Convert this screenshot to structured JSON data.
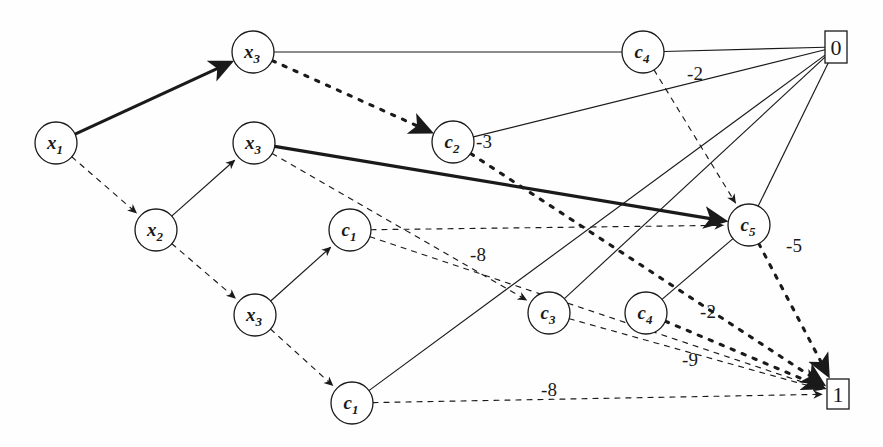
{
  "figure": {
    "kind": "directed-graph-diagram",
    "background": "#fefefe",
    "ink": "#1a1a1a",
    "width": 883,
    "height": 447
  },
  "nodes": [
    {
      "id": "x3_top",
      "base": "x",
      "sub": "3",
      "label": "x3",
      "shape": "circle",
      "cx": 253,
      "cy": 52,
      "r": 21
    },
    {
      "id": "x1",
      "base": "x",
      "sub": "1",
      "label": "x1",
      "shape": "circle",
      "cx": 56,
      "cy": 143,
      "r": 21
    },
    {
      "id": "x3_mid",
      "base": "x",
      "sub": "3",
      "label": "x3",
      "shape": "circle",
      "cx": 254,
      "cy": 143,
      "r": 21
    },
    {
      "id": "x2",
      "base": "x",
      "sub": "2",
      "label": "x2",
      "shape": "circle",
      "cx": 156,
      "cy": 230,
      "r": 21
    },
    {
      "id": "x3_low",
      "base": "x",
      "sub": "3",
      "label": "x3",
      "shape": "circle",
      "cx": 255,
      "cy": 315,
      "r": 21
    },
    {
      "id": "c1_up",
      "base": "c",
      "sub": "1",
      "label": "c1",
      "shape": "circle",
      "cx": 350,
      "cy": 230,
      "r": 21
    },
    {
      "id": "c1_low",
      "base": "c",
      "sub": "1",
      "label": "c1",
      "shape": "circle",
      "cx": 352,
      "cy": 403,
      "r": 21
    },
    {
      "id": "c2",
      "base": "c",
      "sub": "2",
      "label": "c2",
      "shape": "circle",
      "cx": 453,
      "cy": 142,
      "r": 21
    },
    {
      "id": "c3",
      "base": "c",
      "sub": "3",
      "label": "c3",
      "shape": "circle",
      "cx": 549,
      "cy": 313,
      "r": 21
    },
    {
      "id": "c4_low",
      "base": "c",
      "sub": "4",
      "label": "c4",
      "shape": "circle",
      "cx": 646,
      "cy": 313,
      "r": 21
    },
    {
      "id": "c4_top",
      "base": "c",
      "sub": "4",
      "label": "c4",
      "shape": "circle",
      "cx": 643,
      "cy": 52,
      "r": 21
    },
    {
      "id": "c5",
      "base": "c",
      "sub": "5",
      "label": "c5",
      "shape": "circle",
      "cx": 749,
      "cy": 225,
      "r": 21
    },
    {
      "id": "term0",
      "base": "0",
      "sub": "",
      "label": "0",
      "shape": "box",
      "cx": 836,
      "cy": 47,
      "w": 22,
      "h": 32
    },
    {
      "id": "term1",
      "base": "1",
      "sub": "",
      "label": "1",
      "shape": "box",
      "cx": 838,
      "cy": 394,
      "w": 22,
      "h": 30
    }
  ],
  "edges": [
    {
      "id": "e1",
      "from": "x1",
      "to": "x3_top",
      "style": "solid",
      "weight": "thick",
      "arrow": true,
      "label": ""
    },
    {
      "id": "e2",
      "from": "x1",
      "to": "x2",
      "style": "dashed",
      "weight": "thin",
      "arrow": true,
      "label": ""
    },
    {
      "id": "e3",
      "from": "x2",
      "to": "x3_mid",
      "style": "solid",
      "weight": "thin",
      "arrow": true,
      "label": ""
    },
    {
      "id": "e4",
      "from": "x2",
      "to": "x3_low",
      "style": "dashed",
      "weight": "thin",
      "arrow": true,
      "label": ""
    },
    {
      "id": "e5",
      "from": "x3_low",
      "to": "c1_up",
      "style": "solid",
      "weight": "thin",
      "arrow": true,
      "label": ""
    },
    {
      "id": "e6",
      "from": "x3_low",
      "to": "c1_low",
      "style": "dashed",
      "weight": "thin",
      "arrow": true,
      "label": ""
    },
    {
      "id": "e7",
      "from": "x3_top",
      "to": "c4_top",
      "style": "solid",
      "weight": "thin",
      "arrow": false,
      "label": ""
    },
    {
      "id": "e8",
      "from": "x3_top",
      "to": "c2",
      "style": "dashed",
      "weight": "thick",
      "arrow": true,
      "label": ""
    },
    {
      "id": "e9",
      "from": "x3_mid",
      "to": "c5",
      "style": "solid",
      "weight": "thick",
      "arrow": true,
      "label": ""
    },
    {
      "id": "e10",
      "from": "x3_mid",
      "to": "c3",
      "style": "dashed",
      "weight": "thin",
      "arrow": true,
      "label": ""
    },
    {
      "id": "e11",
      "from": "c4_top",
      "to": "term0",
      "style": "solid",
      "weight": "thin",
      "arrow": false,
      "label": ""
    },
    {
      "id": "e12",
      "from": "c2",
      "to": "term0",
      "style": "solid",
      "weight": "thin",
      "arrow": false,
      "label": "-3"
    },
    {
      "id": "e13",
      "from": "c4_top",
      "to": "c5",
      "style": "dashed",
      "weight": "thin",
      "arrow": true,
      "label": "-2"
    },
    {
      "id": "e14",
      "from": "c1_up",
      "to": "c5",
      "style": "dashed",
      "weight": "thin",
      "arrow": true,
      "label": ""
    },
    {
      "id": "e15",
      "from": "c1_up",
      "to": "term1",
      "style": "dashed",
      "weight": "thin",
      "arrow": true,
      "label": "-8"
    },
    {
      "id": "e16",
      "from": "c1_low",
      "to": "term1",
      "style": "dashed",
      "weight": "thin",
      "arrow": true,
      "label": "-8"
    },
    {
      "id": "e17",
      "from": "c1_low",
      "to": "term0",
      "style": "solid",
      "weight": "thin",
      "arrow": false,
      "label": ""
    },
    {
      "id": "e18",
      "from": "c3",
      "to": "term0",
      "style": "solid",
      "weight": "thin",
      "arrow": false,
      "label": ""
    },
    {
      "id": "e19",
      "from": "c3",
      "to": "term1",
      "style": "dashed",
      "weight": "thin",
      "arrow": true,
      "label": "-9"
    },
    {
      "id": "e20",
      "from": "c4_low",
      "to": "c5",
      "style": "solid",
      "weight": "thin",
      "arrow": false,
      "label": ""
    },
    {
      "id": "e21",
      "from": "c4_low",
      "to": "term1",
      "style": "dashed",
      "weight": "thick",
      "arrow": true,
      "label": "-2"
    },
    {
      "id": "e22",
      "from": "c5",
      "to": "term0",
      "style": "solid",
      "weight": "thin",
      "arrow": false,
      "label": ""
    },
    {
      "id": "e23",
      "from": "c5",
      "to": "term1",
      "style": "dashed",
      "weight": "thick",
      "arrow": true,
      "label": "-5"
    },
    {
      "id": "e24",
      "from": "c2",
      "to": "term1",
      "style": "dashed",
      "weight": "thick",
      "arrow": true,
      "label": ""
    }
  ],
  "edge_labels": [
    {
      "id": "l_m2_top",
      "text": "-2",
      "x": 695,
      "y": 80
    },
    {
      "id": "l_m3",
      "text": "-3",
      "x": 484,
      "y": 148
    },
    {
      "id": "l_m5",
      "text": "-5",
      "x": 794,
      "y": 252
    },
    {
      "id": "l_m8_mid",
      "text": "-8",
      "x": 478,
      "y": 261
    },
    {
      "id": "l_m2_low",
      "text": "-2",
      "x": 708,
      "y": 318
    },
    {
      "id": "l_m9",
      "text": "-9",
      "x": 690,
      "y": 366
    },
    {
      "id": "l_m8_bot",
      "text": "-8",
      "x": 549,
      "y": 396
    }
  ]
}
